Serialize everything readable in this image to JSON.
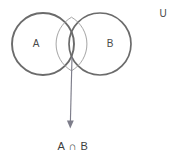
{
  "figure": {
    "background_color": "#ffffff",
    "width": 175,
    "height": 159
  },
  "diagram": {
    "type": "venn",
    "stroke_color": "#6b6b6b",
    "lens_stroke_color": "#9a9a9a",
    "arrow_color": "#7d7d8a",
    "text_color": "#4a4a4a",
    "caption_color": "#3d3d3d",
    "circles": [
      {
        "id": "set-a",
        "label": "A",
        "cx": 43,
        "cy": 44,
        "r": 31,
        "label_x": 36,
        "label_y": 44
      },
      {
        "id": "set-b",
        "label": "B",
        "cx": 100,
        "cy": 44,
        "r": 31,
        "label_x": 110,
        "label_y": 44
      }
    ],
    "universe": {
      "label": "U",
      "x": 163,
      "y": 14
    },
    "intersection": {
      "label": "A ∩ B",
      "label_x": 73,
      "label_y": 147,
      "region_name": "lens"
    },
    "arrow": {
      "from_x": 72,
      "from_y": 57,
      "to_x": 70,
      "to_y": 128
    }
  }
}
